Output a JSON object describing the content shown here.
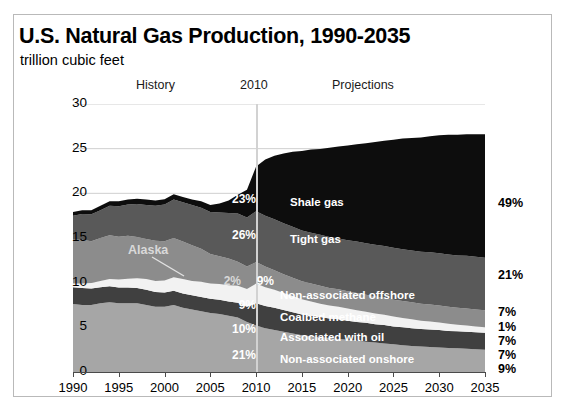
{
  "header": {
    "title": "U.S. Natural Gas Production, 1990-2035",
    "subtitle": "trillion cubic feet",
    "history_label": "History",
    "year_marker_label": "2010",
    "projections_label": "Projections"
  },
  "annotations": {
    "alaska": "Alaska"
  },
  "colors": {
    "shale_gas": "#0d0d0d",
    "tight_gas": "#595959",
    "non_associated_offshore": "#8c8c8c",
    "coalbed_methane": "#f2f2f2",
    "associated_with_oil": "#404040",
    "non_associated_onshore": "#a6a6a6",
    "gridline": "#cfcfcf",
    "axis": "#4a4a4a",
    "divider_2010": "#d2d2d2",
    "frame_border": "#b9b9b9"
  },
  "chart_data": {
    "type": "area",
    "title": "U.S. Natural Gas Production, 1990-2035",
    "subtitle": "trillion cubic feet",
    "xlabel": "",
    "ylabel": "trillion cubic feet",
    "xlim": [
      1990,
      2035
    ],
    "ylim": [
      0,
      30
    ],
    "yticks": [
      0,
      5,
      10,
      15,
      20,
      25,
      30
    ],
    "ytick_labels": [
      "0",
      "5",
      "10",
      "15",
      "20",
      "25",
      "30"
    ],
    "xticks": [
      1990,
      1995,
      2000,
      2005,
      2010,
      2015,
      2020,
      2025,
      2030,
      2035
    ],
    "xtick_labels": [
      "1990",
      "1995",
      "2000",
      "2005",
      "2010",
      "2015",
      "2020",
      "2025",
      "2030",
      "2035"
    ],
    "grid": true,
    "stacked": true,
    "legend": "inline-labels",
    "x": [
      1990,
      1991,
      1992,
      1993,
      1994,
      1995,
      1996,
      1997,
      1998,
      1999,
      2000,
      2001,
      2002,
      2003,
      2004,
      2005,
      2006,
      2007,
      2008,
      2009,
      2010,
      2011,
      2012,
      2013,
      2014,
      2015,
      2016,
      2017,
      2018,
      2019,
      2020,
      2021,
      2022,
      2023,
      2024,
      2025,
      2026,
      2027,
      2028,
      2029,
      2030,
      2031,
      2032,
      2033,
      2034,
      2035
    ],
    "series": [
      {
        "name": "Non-associated onshore",
        "order": 1,
        "color": "#a6a6a6",
        "share_2010_label": "21%",
        "share_2035_label": "9%",
        "values": [
          7.6,
          7.5,
          7.5,
          7.7,
          7.8,
          7.7,
          7.7,
          7.7,
          7.5,
          7.3,
          7.3,
          7.5,
          7.2,
          7.0,
          6.8,
          6.6,
          6.5,
          6.3,
          6.1,
          5.6,
          5.2,
          4.9,
          4.7,
          4.5,
          4.3,
          4.1,
          4.0,
          3.9,
          3.8,
          3.7,
          3.6,
          3.5,
          3.4,
          3.3,
          3.2,
          3.1,
          3.0,
          2.9,
          2.85,
          2.8,
          2.75,
          2.7,
          2.65,
          2.6,
          2.55,
          2.5
        ]
      },
      {
        "name": "Associated with oil",
        "order": 2,
        "color": "#404040",
        "share_2010_label": "10%",
        "share_2035_label": "7%",
        "values": [
          1.9,
          1.9,
          1.85,
          1.8,
          1.8,
          1.75,
          1.75,
          1.7,
          1.7,
          1.65,
          1.6,
          1.6,
          1.6,
          1.6,
          1.6,
          1.6,
          1.6,
          1.6,
          1.65,
          1.7,
          2.5,
          2.5,
          2.5,
          2.45,
          2.4,
          2.35,
          2.3,
          2.25,
          2.2,
          2.2,
          2.15,
          2.1,
          2.1,
          2.05,
          2.05,
          2.0,
          2.0,
          2.0,
          1.95,
          1.95,
          1.95,
          1.9,
          1.9,
          1.9,
          1.9,
          1.9
        ]
      },
      {
        "name": "Coalbed methane",
        "order": 3,
        "color": "#f2f2f2",
        "share_2010_label": "9%",
        "share_2035_label": "1%",
        "values": [
          0.4,
          0.5,
          0.6,
          0.7,
          0.8,
          0.9,
          1.0,
          1.1,
          1.2,
          1.25,
          1.35,
          1.5,
          1.6,
          1.6,
          1.7,
          1.7,
          1.75,
          1.8,
          1.9,
          2.0,
          2.2,
          2.1,
          2.0,
          1.9,
          1.8,
          1.7,
          1.6,
          1.5,
          1.45,
          1.4,
          1.35,
          1.3,
          1.25,
          1.2,
          1.15,
          1.1,
          1.05,
          1.0,
          0.95,
          0.9,
          0.85,
          0.8,
          0.75,
          0.7,
          0.65,
          0.6
        ]
      },
      {
        "name": "Non-associated offshore",
        "order": 4,
        "color": "#8c8c8c",
        "share_2010_label": "9%",
        "share_2035_label": "7%",
        "alaska_share_label": "2%",
        "values": [
          4.9,
          4.9,
          4.7,
          4.8,
          4.9,
          4.8,
          4.8,
          4.6,
          4.5,
          4.5,
          4.4,
          4.4,
          4.2,
          4.0,
          3.7,
          3.3,
          3.1,
          3.0,
          2.7,
          2.5,
          2.4,
          2.3,
          2.2,
          2.1,
          2.05,
          2.0,
          2.0,
          2.0,
          1.95,
          1.95,
          1.95,
          1.95,
          1.9,
          1.9,
          1.9,
          1.9,
          1.9,
          1.9,
          1.9,
          1.9,
          1.9,
          1.9,
          1.9,
          1.9,
          1.9,
          1.9
        ]
      },
      {
        "name": "Tight gas",
        "order": 5,
        "color": "#595959",
        "share_2010_label": "26%",
        "share_2035_label": "21%",
        "values": [
          2.7,
          2.9,
          3.0,
          3.1,
          3.3,
          3.4,
          3.5,
          3.7,
          3.8,
          3.9,
          4.1,
          4.3,
          4.4,
          4.5,
          4.6,
          4.7,
          4.9,
          5.1,
          5.4,
          5.5,
          5.7,
          5.7,
          5.7,
          5.7,
          5.7,
          5.7,
          5.7,
          5.7,
          5.7,
          5.7,
          5.7,
          5.75,
          5.75,
          5.8,
          5.8,
          5.8,
          5.8,
          5.8,
          5.8,
          5.85,
          5.85,
          5.85,
          5.85,
          5.9,
          5.9,
          5.9
        ]
      },
      {
        "name": "Shale gas",
        "order": 6,
        "color": "#0d0d0d",
        "share_2010_label": "23%",
        "share_2035_label": "49%",
        "values": [
          0.4,
          0.4,
          0.45,
          0.5,
          0.5,
          0.55,
          0.55,
          0.6,
          0.6,
          0.6,
          0.6,
          0.6,
          0.6,
          0.6,
          0.7,
          0.8,
          1.0,
          1.4,
          2.1,
          3.1,
          5.0,
          6.3,
          7.1,
          7.8,
          8.4,
          8.9,
          9.3,
          9.6,
          10.0,
          10.3,
          10.6,
          10.9,
          11.2,
          11.5,
          11.8,
          12.1,
          12.4,
          12.6,
          12.8,
          13.0,
          13.2,
          13.4,
          13.5,
          13.6,
          13.7,
          13.8
        ]
      }
    ],
    "inline_labels": [
      {
        "text": "Shale gas",
        "x_px": 290,
        "y_px": 196
      },
      {
        "text": "Tight gas",
        "x_px": 290,
        "y_px": 233
      },
      {
        "text": "Non-associated offshore",
        "x_px": 280,
        "y_px": 289
      },
      {
        "text": "Coalbed methane",
        "x_px": 280,
        "y_px": 311
      },
      {
        "text": "Associated with oil",
        "x_px": 280,
        "y_px": 331
      },
      {
        "text": "Non-associated onshore",
        "x_px": 280,
        "y_px": 353
      }
    ],
    "right_share_labels": [
      "49%",
      "21%",
      "7%",
      "1%",
      "7%",
      "7%",
      "9%"
    ],
    "left_share_labels": [
      "23%",
      "26%",
      "2%",
      "9%",
      "9%",
      "10%",
      "21%"
    ]
  }
}
